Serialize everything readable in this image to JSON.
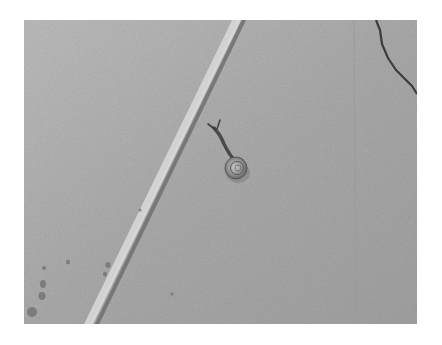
{
  "image": {
    "description": "Grayscale photo of a small snail crawling on a concrete surface with a diagonal groove and a crack in the upper right corner",
    "subject": "snail",
    "colors": {
      "background": "#ffffff",
      "concrete_light": "#b9b9b9",
      "concrete_dark": "#9f9f9f",
      "groove_highlight": "#d4d4d4",
      "groove_shadow": "#6e6e6e",
      "crack": "#3c3c3c",
      "snail_shell": "#8a8a8a"
    }
  }
}
